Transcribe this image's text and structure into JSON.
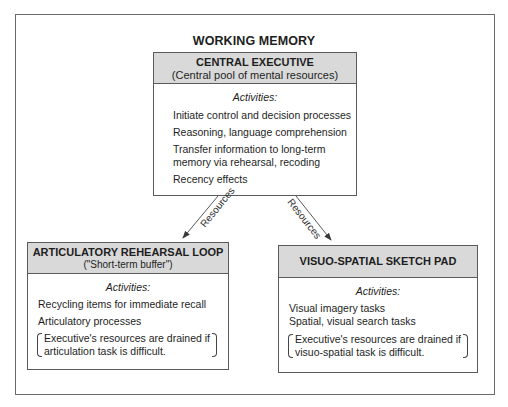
{
  "diagram": {
    "title": "WORKING MEMORY",
    "central_executive": {
      "title": "CENTRAL EXECUTIVE",
      "subtitle": "(Central pool of mental resources)",
      "activities_label": "Activities:",
      "activities": [
        "Initiate control and decision processes",
        "Reasoning, language comprehension",
        "Transfer information to long-term",
        "memory via rehearsal, recoding",
        "Recency effects"
      ]
    },
    "arrows": [
      {
        "label": "Resources",
        "from": "central_executive",
        "to": "articulatory_loop"
      },
      {
        "label": "Resources",
        "from": "central_executive",
        "to": "sketch_pad"
      }
    ],
    "articulatory_loop": {
      "title": "ARTICULATORY REHEARSAL LOOP",
      "subtitle": "(\"Short-term buffer\")",
      "activities_label": "Activities:",
      "activities": [
        "Recycling items for immediate recall",
        "Articulatory processes"
      ],
      "note_line1": "Executive's resources are drained if",
      "note_line2": "articulation task is difficult."
    },
    "sketch_pad": {
      "title": "VISUO-SPATIAL SKETCH PAD",
      "activities_label": "Activities:",
      "activities": [
        "Visual imagery tasks",
        "Spatial, visual search tasks"
      ],
      "note_line1": "Executive's resources are drained if",
      "note_line2": "visuo-spatial task is difficult."
    }
  },
  "colors": {
    "header_fill": "#d9d9d9",
    "border": "#5a5a5a",
    "text": "#1e1e1e"
  }
}
